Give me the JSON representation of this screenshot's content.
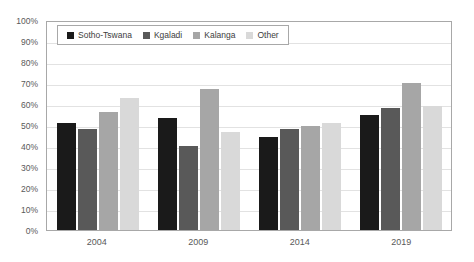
{
  "chart_data": {
    "type": "bar",
    "title": "",
    "xlabel": "",
    "ylabel": "",
    "ylim": [
      0,
      100
    ],
    "grid": true,
    "legend_position": "top-left-inside",
    "categories": [
      "2004",
      "2009",
      "2014",
      "2019"
    ],
    "ytick_labels": [
      "100%",
      "90%",
      "80%",
      "70%",
      "60%",
      "50%",
      "40%",
      "30%",
      "20%",
      "10%",
      "0%"
    ],
    "ytick_values": [
      100,
      90,
      80,
      70,
      60,
      50,
      40,
      30,
      20,
      10,
      0
    ],
    "series": [
      {
        "name": "Sotho-Tswana",
        "color": "#1a1a1a",
        "values": [
          51,
          53.5,
          44.5,
          55
        ]
      },
      {
        "name": "Kgaladi",
        "color": "#595959",
        "values": [
          48,
          40,
          48,
          58
        ]
      },
      {
        "name": "Kalanga",
        "color": "#a6a6a6",
        "values": [
          56,
          67,
          49.5,
          70
        ]
      },
      {
        "name": "Other",
        "color": "#d9d9d9",
        "values": [
          63,
          46.5,
          51,
          59
        ]
      }
    ]
  }
}
